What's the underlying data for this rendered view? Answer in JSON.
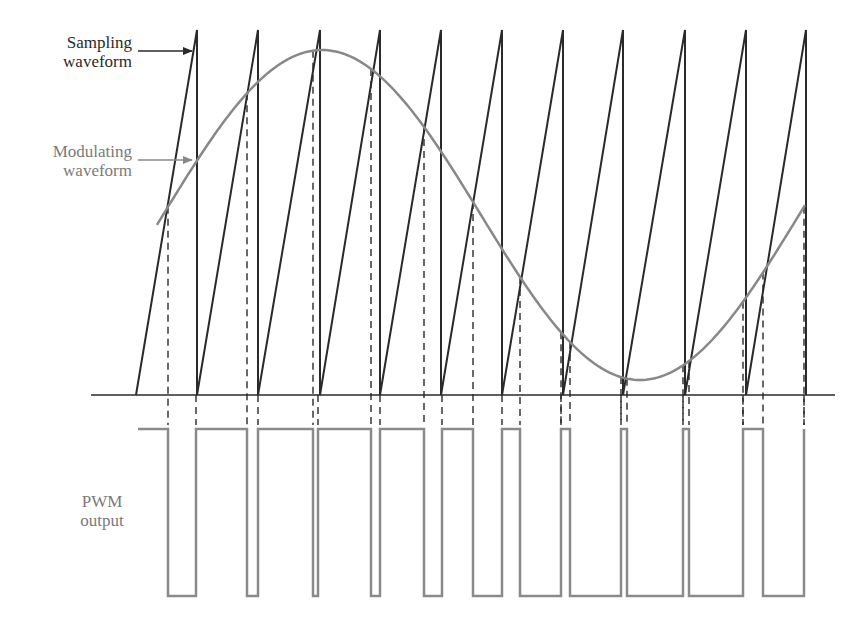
{
  "labels": {
    "sampling": [
      "Sampling",
      "waveform"
    ],
    "modulating": [
      "Modulating",
      "waveform"
    ],
    "pwm": [
      "PWM",
      "output"
    ]
  },
  "colors": {
    "sawtooth": "#2a2a2a",
    "modulating": "#888888",
    "pwm": "#8a8a8a",
    "axis": "#2a2a2a",
    "dashed": "#2a2a2a"
  },
  "geometry": {
    "baseline": {
      "x1": 91,
      "x2": 835,
      "y": 395
    },
    "sawtooth": {
      "start_x": 136,
      "peak_y": 30,
      "base_y": 395,
      "peaks_x": [
        197,
        258,
        320,
        380,
        441,
        502,
        563,
        623,
        685,
        746,
        806
      ]
    },
    "modulating": {
      "x_start": 157,
      "x_end": 805,
      "peak_x": 322,
      "mid_y": 215,
      "amplitude": 165,
      "half_period": 318
    },
    "crossings_x": [
      168,
      247,
      313,
      371,
      424,
      473,
      520,
      561,
      570,
      621,
      627,
      683,
      689,
      743,
      763,
      804
    ],
    "sawtooth_returns_x": [
      196,
      258,
      318,
      380,
      442,
      502,
      561,
      621,
      683,
      743,
      804
    ],
    "pwm": {
      "high_y": 429,
      "low_y": 596,
      "start_x": 138,
      "transitions_x": [
        168,
        196,
        247,
        258,
        313,
        318,
        371,
        380,
        424,
        442,
        473,
        502,
        520,
        561,
        570,
        621,
        627,
        683,
        689,
        743,
        763,
        804
      ]
    },
    "arrows": {
      "sampling": {
        "x1": 138,
        "x2": 192,
        "y": 51
      },
      "modulating": {
        "x1": 138,
        "x2": 192,
        "y": 160
      }
    }
  },
  "chart_data": {
    "type": "line",
    "series": [
      {
        "name": "Sampling waveform",
        "shape": "sawtooth",
        "periods": 11
      },
      {
        "name": "Modulating waveform",
        "shape": "sinusoid",
        "cycles_shown": 1.0
      },
      {
        "name": "PWM output",
        "shape": "pulse train",
        "levels": [
          "high",
          "low"
        ]
      }
    ],
    "xlabel": "",
    "ylabel": ""
  }
}
